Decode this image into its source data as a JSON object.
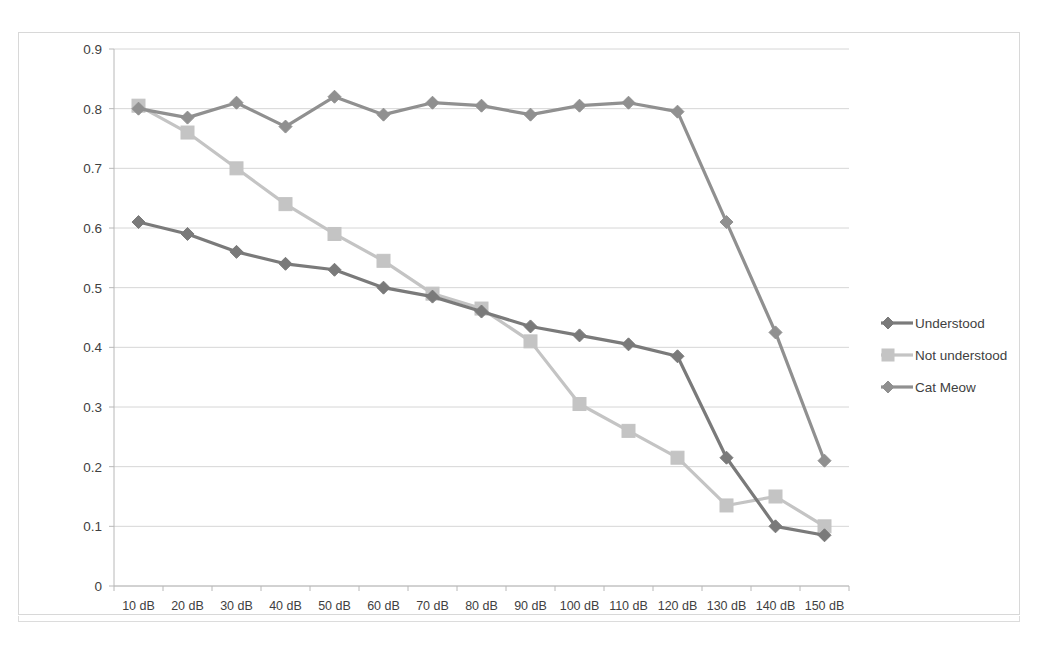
{
  "chart_data": {
    "type": "line",
    "title": "",
    "subtitle": "",
    "xlabel": "",
    "ylabel": "",
    "grid": true,
    "legend_position": "right",
    "ylim": [
      0,
      0.9
    ],
    "ytick_labels": [
      "0.9",
      "0.8",
      "0.7",
      "0.6",
      "0.5",
      "0.4",
      "0.3",
      "0.2",
      "0.1",
      "0"
    ],
    "ytick_values": [
      0.9,
      0.8,
      0.7,
      0.6,
      0.5,
      0.4,
      0.3,
      0.2,
      0.1,
      0
    ],
    "categories": [
      "10 dB",
      "20 dB",
      "30 dB",
      "40 dB",
      "50 dB",
      "60 dB",
      "70 dB",
      "80 dB",
      "90 dB",
      "100 dB",
      "110 dB",
      "120 dB",
      "130 dB",
      "140 dB",
      "150 dB"
    ],
    "series": [
      {
        "name": "Understood",
        "color": "#7a7a7a",
        "marker": "diamond",
        "values": [
          0.61,
          0.59,
          0.56,
          0.54,
          0.53,
          0.5,
          0.485,
          0.46,
          0.435,
          0.42,
          0.405,
          0.385,
          0.215,
          0.1,
          0.085
        ]
      },
      {
        "name": "Not understood",
        "color": "#c4c4c4",
        "marker": "square",
        "values": [
          0.805,
          0.76,
          0.7,
          0.64,
          0.59,
          0.545,
          0.49,
          0.465,
          0.41,
          0.305,
          0.26,
          0.215,
          0.135,
          0.15,
          0.1
        ]
      },
      {
        "name": "Cat Meow",
        "color": "#909090",
        "marker": "diamond",
        "values": [
          0.8,
          0.785,
          0.81,
          0.77,
          0.82,
          0.79,
          0.81,
          0.805,
          0.79,
          0.805,
          0.81,
          0.795,
          0.61,
          0.425,
          0.21
        ]
      }
    ]
  }
}
